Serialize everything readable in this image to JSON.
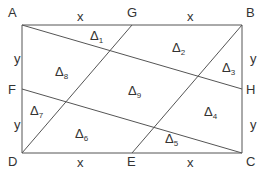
{
  "diagram": {
    "type": "geometry-rectangle-partition",
    "stroke_color": "#555555",
    "text_color": "#333333",
    "points": [
      {
        "id": "A",
        "label": "A",
        "x": 22,
        "y": 25,
        "lx": 8,
        "ly": 17
      },
      {
        "id": "G",
        "label": "G",
        "x": 132,
        "y": 25,
        "lx": 127,
        "ly": 17
      },
      {
        "id": "B",
        "label": "B",
        "x": 242,
        "y": 25,
        "lx": 246,
        "ly": 17
      },
      {
        "id": "H",
        "label": "H",
        "x": 242,
        "y": 89,
        "lx": 246,
        "ly": 94
      },
      {
        "id": "C",
        "label": "C",
        "x": 242,
        "y": 153,
        "lx": 246,
        "ly": 166
      },
      {
        "id": "E",
        "label": "E",
        "x": 132,
        "y": 153,
        "lx": 127,
        "ly": 166
      },
      {
        "id": "D",
        "label": "D",
        "x": 22,
        "y": 153,
        "lx": 8,
        "ly": 166
      },
      {
        "id": "F",
        "label": "F",
        "x": 22,
        "y": 89,
        "lx": 8,
        "ly": 94
      }
    ],
    "segments": [
      {
        "from": "A",
        "to": "B"
      },
      {
        "from": "B",
        "to": "C"
      },
      {
        "from": "C",
        "to": "D"
      },
      {
        "from": "D",
        "to": "A"
      },
      {
        "from": "A",
        "to": "H"
      },
      {
        "from": "F",
        "to": "C"
      },
      {
        "from": "G",
        "to": "D"
      },
      {
        "from": "B",
        "to": "E"
      }
    ],
    "side_labels": [
      {
        "text": "x",
        "x": 77,
        "y": 21
      },
      {
        "text": "x",
        "x": 187,
        "y": 21
      },
      {
        "text": "x",
        "x": 77,
        "y": 167
      },
      {
        "text": "x",
        "x": 187,
        "y": 167
      },
      {
        "text": "y",
        "x": 14,
        "y": 63
      },
      {
        "text": "y",
        "x": 14,
        "y": 129
      },
      {
        "text": "y",
        "x": 250,
        "y": 63
      },
      {
        "text": "y",
        "x": 250,
        "y": 129
      }
    ],
    "regions": [
      {
        "symbol": "Δ",
        "index": "1",
        "x": 90,
        "y": 40
      },
      {
        "symbol": "Δ",
        "index": "2",
        "x": 172,
        "y": 52
      },
      {
        "symbol": "Δ",
        "index": "3",
        "x": 222,
        "y": 72
      },
      {
        "symbol": "Δ",
        "index": "4",
        "x": 204,
        "y": 116
      },
      {
        "symbol": "Δ",
        "index": "5",
        "x": 165,
        "y": 143
      },
      {
        "symbol": "Δ",
        "index": "6",
        "x": 75,
        "y": 138
      },
      {
        "symbol": "Δ",
        "index": "7",
        "x": 30,
        "y": 115
      },
      {
        "symbol": "Δ",
        "index": "8",
        "x": 55,
        "y": 76
      },
      {
        "symbol": "Δ",
        "index": "9",
        "x": 128,
        "y": 95
      }
    ]
  }
}
